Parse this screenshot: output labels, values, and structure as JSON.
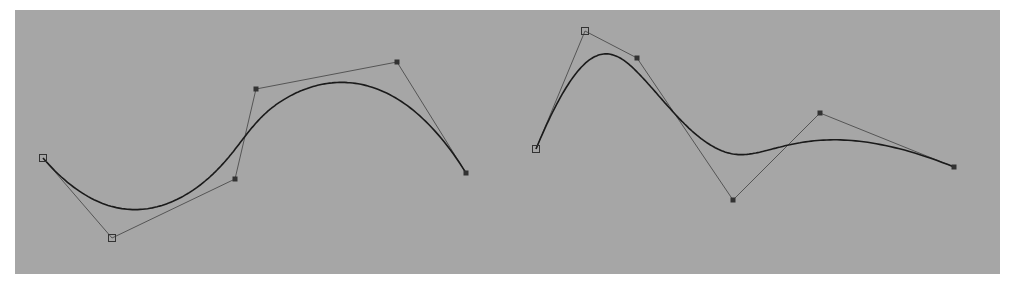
{
  "figure": {
    "background": "#a6a6a6",
    "curve_color": "#1a1a1a",
    "polygon_color": "#555555",
    "curves": [
      {
        "name": "left-bspline",
        "control_points": [
          [
            43,
            158
          ],
          [
            112,
            238
          ],
          [
            235,
            179
          ],
          [
            256,
            89
          ],
          [
            397,
            62
          ],
          [
            466,
            173
          ]
        ],
        "endpoint_markers": "hollow-square",
        "inner_markers": "filled-square"
      },
      {
        "name": "right-bspline",
        "control_points": [
          [
            536,
            149
          ],
          [
            585,
            31
          ],
          [
            637,
            58
          ],
          [
            733,
            200
          ],
          [
            820,
            113
          ],
          [
            954,
            167
          ]
        ],
        "endpoint_markers": "hollow-square",
        "inner_markers": "filled-square"
      }
    ]
  }
}
